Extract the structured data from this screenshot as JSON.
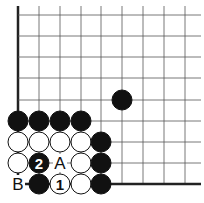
{
  "diagram": {
    "type": "go-board-fragment",
    "corner": "bottom-left",
    "grid": {
      "cols_x": [
        18,
        39,
        60,
        81,
        101,
        122,
        143,
        164,
        185
      ],
      "rows_y": [
        15,
        36,
        57,
        78,
        100,
        121,
        142,
        163,
        184
      ],
      "line_color": "#555555",
      "edge_color": "#222222"
    },
    "stones": [
      {
        "color": "black",
        "col": 5,
        "row": 4
      },
      {
        "color": "black",
        "col": 0,
        "row": 5
      },
      {
        "color": "black",
        "col": 1,
        "row": 5
      },
      {
        "color": "black",
        "col": 2,
        "row": 5
      },
      {
        "color": "black",
        "col": 3,
        "row": 5
      },
      {
        "color": "white",
        "col": 0,
        "row": 6
      },
      {
        "color": "white",
        "col": 1,
        "row": 6
      },
      {
        "color": "white",
        "col": 2,
        "row": 6
      },
      {
        "color": "white",
        "col": 3,
        "row": 6
      },
      {
        "color": "black",
        "col": 4,
        "row": 6
      },
      {
        "color": "white",
        "col": 0,
        "row": 7
      },
      {
        "color": "black",
        "col": 1,
        "row": 7,
        "label": "2"
      },
      {
        "color": "white",
        "col": 3,
        "row": 7
      },
      {
        "color": "black",
        "col": 4,
        "row": 7
      },
      {
        "color": "black",
        "col": 1,
        "row": 8
      },
      {
        "color": "white",
        "col": 2,
        "row": 8,
        "label": "1"
      },
      {
        "color": "white",
        "col": 3,
        "row": 8
      },
      {
        "color": "black",
        "col": 4,
        "row": 8
      }
    ],
    "point_labels": [
      {
        "text": "A",
        "col": 2,
        "row": 7
      },
      {
        "text": "B",
        "col": 0,
        "row": 8
      }
    ],
    "move_labels": {
      "move1": "1",
      "move2": "2"
    }
  }
}
